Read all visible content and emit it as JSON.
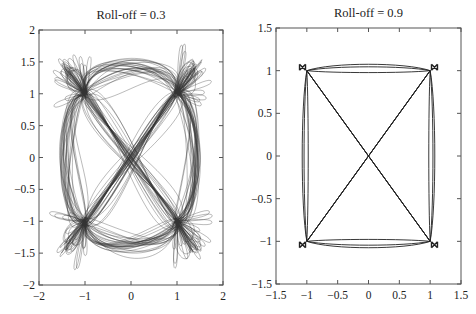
{
  "chart_data": [
    {
      "type": "scatter",
      "subtype": "eye-diagram / constellation trajectory (QPSK raised-cosine)",
      "title": "Roll-off = 0.3",
      "xlabel": "",
      "ylabel": "",
      "xlim": [
        -2,
        2
      ],
      "ylim": [
        -2,
        2
      ],
      "xticks": [
        -2,
        -1,
        0,
        1,
        2
      ],
      "xtick_labels": [
        "−2",
        "−1",
        "0",
        "1",
        "2"
      ],
      "yticks": [
        -2,
        -1.5,
        -1,
        -0.5,
        0,
        0.5,
        1,
        1.5,
        2
      ],
      "ytick_labels": [
        "−2",
        "−1.5",
        "−1",
        "−0.5",
        "0",
        "0.5",
        "1",
        "1.5",
        "2"
      ],
      "grid": false,
      "legend": null,
      "constellation_points": [
        [
          1,
          1
        ],
        [
          -1,
          1
        ],
        [
          -1,
          -1
        ],
        [
          1,
          -1
        ]
      ],
      "trajectory_extent": {
        "x": [
          -1.75,
          1.75
        ],
        "y": [
          -1.75,
          1.75
        ]
      },
      "line_color": "#333333"
    },
    {
      "type": "scatter",
      "subtype": "eye-diagram / constellation trajectory (QPSK raised-cosine)",
      "title": "Roll-off = 0.9",
      "xlabel": "",
      "ylabel": "",
      "xlim": [
        -1.5,
        1.5
      ],
      "ylim": [
        -1.5,
        1.5
      ],
      "xticks": [
        -1.5,
        -1,
        -0.5,
        0,
        0.5,
        1,
        1.5
      ],
      "xtick_labels": [
        "−1.5",
        "−1",
        "−0.5",
        "0",
        "0.5",
        "1",
        "1.5"
      ],
      "yticks": [
        -1.5,
        -1,
        -0.5,
        0,
        0.5,
        1,
        1.5
      ],
      "ytick_labels": [
        "−1.5",
        "−1",
        "−0.5",
        "0",
        "0.5",
        "1",
        "1.5"
      ],
      "grid": false,
      "legend": null,
      "constellation_points": [
        [
          1,
          1
        ],
        [
          -1,
          1
        ],
        [
          -1,
          -1
        ],
        [
          1,
          -1
        ]
      ],
      "trajectory_extent": {
        "x": [
          -1.1,
          1.1
        ],
        "y": [
          -1.1,
          1.1
        ]
      },
      "line_color": "#222222"
    }
  ]
}
